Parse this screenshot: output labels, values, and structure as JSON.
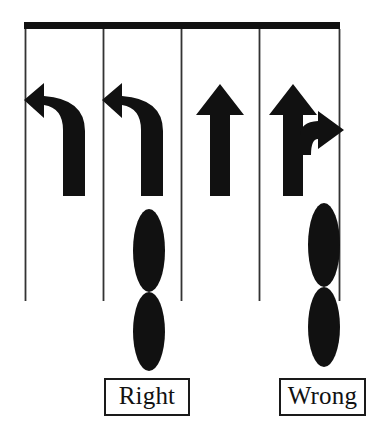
{
  "figure": {
    "type": "traffic-lane-marking-diagram",
    "background_color": "#ffffff",
    "ink_color": "#111111",
    "line_color": "#333333",
    "canvas": {
      "width": 381,
      "height": 431
    }
  },
  "stop_bar": {
    "name": "stop-bar",
    "x": 24,
    "y": 22,
    "width": 316,
    "height": 7,
    "color": "#111111"
  },
  "lane_lines": [
    {
      "id": "lane-line-1",
      "x": 25,
      "y_top": 29,
      "y_bottom": 301
    },
    {
      "id": "lane-line-2",
      "x": 103,
      "y_top": 29,
      "y_bottom": 301
    },
    {
      "id": "lane-line-3",
      "x": 181,
      "y_top": 29,
      "y_bottom": 301
    },
    {
      "id": "lane-line-4",
      "x": 259,
      "y_top": 29,
      "y_bottom": 301
    },
    {
      "id": "lane-line-5",
      "x": 339,
      "y_top": 29,
      "y_bottom": 301
    }
  ],
  "lanes": [
    {
      "index": 1,
      "arrow_name": "left-turn-arrow",
      "arrow_label": "Left turn",
      "center_x": 64,
      "has_marker": false
    },
    {
      "index": 2,
      "arrow_name": "left-turn-arrow",
      "arrow_label": "Left turn",
      "center_x": 142,
      "has_marker": true,
      "marker_name": "correct-marker",
      "marker_verdict": "Right"
    },
    {
      "index": 3,
      "arrow_name": "straight-arrow",
      "arrow_label": "Straight ahead",
      "center_x": 220,
      "has_marker": false
    },
    {
      "index": 4,
      "arrow_name": "straight-and-right-turn-arrow",
      "arrow_label": "Straight and right turn",
      "center_x": 293,
      "has_marker": true,
      "marker_name": "incorrect-marker",
      "marker_verdict": "Wrong"
    }
  ],
  "markers": {
    "correct": {
      "name": "loop-detector-marker-correct",
      "center_x": 149,
      "top_y": 209,
      "bottom_y": 371,
      "pinch_y": 292,
      "ellipse_rx": 16,
      "description": "two stacked vertical ellipses centered within the lane, clear of the lane line"
    },
    "incorrect": {
      "name": "loop-detector-marker-incorrect",
      "center_x": 324,
      "top_y": 203,
      "bottom_y": 367,
      "pinch_y": 287,
      "ellipse_rx": 16,
      "description": "two stacked vertical ellipses straddling and overlapping the lane line"
    }
  },
  "labels": {
    "right": {
      "text": "Right",
      "name": "label-right",
      "points_to_lane": 2
    },
    "wrong": {
      "text": "Wrong",
      "name": "label-wrong",
      "points_to_lane": 4
    }
  }
}
